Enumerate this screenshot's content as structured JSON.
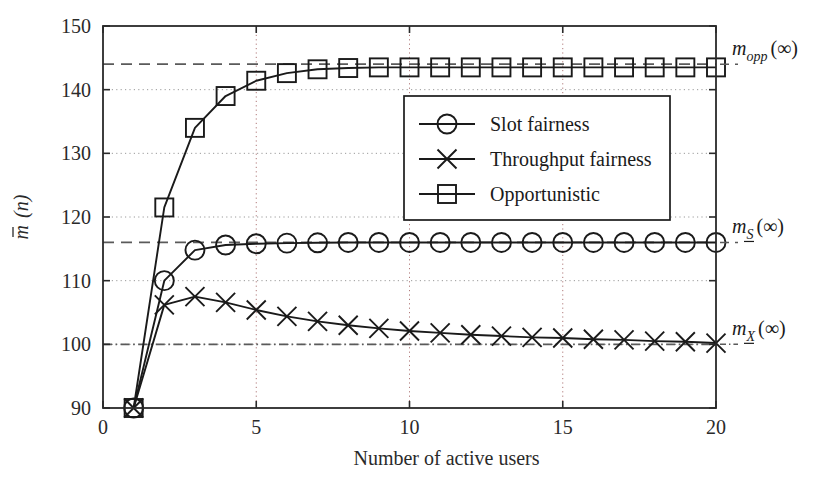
{
  "chart_data": {
    "type": "line",
    "title": "",
    "xlabel": "Number of active users",
    "ylabel": "m̄ (n)",
    "ylabel_parts": {
      "sym": "m",
      "overbar": true,
      "arg": "(n)"
    },
    "xlim": [
      0,
      20
    ],
    "ylim": [
      90,
      150
    ],
    "xticks": [
      0,
      5,
      10,
      15,
      20
    ],
    "xtick_labels": [
      "0",
      "5",
      "10",
      "15",
      "20"
    ],
    "yticks": [
      90,
      100,
      110,
      120,
      130,
      140,
      150
    ],
    "ytick_labels": [
      "90",
      "100",
      "110",
      "120",
      "130",
      "140",
      "150"
    ],
    "grid": true,
    "grid_style": "dotted",
    "grid_x_values": [
      5,
      10,
      15
    ],
    "grid_y_values": [
      100,
      110,
      120,
      130,
      140
    ],
    "legend_position": "upper-center-right",
    "x": [
      1,
      2,
      3,
      4,
      5,
      6,
      7,
      8,
      9,
      10,
      11,
      12,
      13,
      14,
      15,
      16,
      17,
      18,
      19,
      20
    ],
    "series": [
      {
        "name": "Slot fairness",
        "marker": "circle",
        "color": "#1a1a1a",
        "values": [
          90,
          110.0,
          114.8,
          115.6,
          115.8,
          115.9,
          115.95,
          116.0,
          116.0,
          116.0,
          116.0,
          116.0,
          116.0,
          116.0,
          116.0,
          116.0,
          116.0,
          116.0,
          116.0,
          116.0
        ]
      },
      {
        "name": "Throughput fairness",
        "marker": "cross",
        "color": "#1a1a1a",
        "values": [
          90,
          106.2,
          107.5,
          106.6,
          105.4,
          104.4,
          103.6,
          103.0,
          102.5,
          102.1,
          101.8,
          101.5,
          101.3,
          101.1,
          101.0,
          100.8,
          100.7,
          100.5,
          100.4,
          100.2
        ]
      },
      {
        "name": "Opportunistic",
        "marker": "square",
        "color": "#1a1a1a",
        "values": [
          90,
          121.5,
          134.0,
          139.0,
          141.4,
          142.6,
          143.2,
          143.4,
          143.5,
          143.5,
          143.5,
          143.5,
          143.5,
          143.5,
          143.5,
          143.5,
          143.5,
          143.5,
          143.5,
          143.5
        ]
      }
    ],
    "asymptotes": [
      {
        "label_sym": "m",
        "label_sub": "opp",
        "label_arg": "(∞)",
        "value": 144.0,
        "style": "dashed",
        "sub_underline": false,
        "color": "#5a5a5a"
      },
      {
        "label_sym": "m",
        "label_sub": "S",
        "label_arg": "(∞)",
        "value": 116.0,
        "style": "dashed",
        "sub_underline": true,
        "color": "#5a5a5a"
      },
      {
        "label_sym": "m",
        "label_sub": "X",
        "label_arg": "(∞)",
        "value": 100.0,
        "style": "dashdot",
        "sub_underline": true,
        "color": "#5a5a5a"
      }
    ]
  },
  "legend": {
    "entries": [
      {
        "label": "Slot fairness",
        "marker": "circle"
      },
      {
        "label": "Throughput fairness",
        "marker": "cross"
      },
      {
        "label": "Opportunistic",
        "marker": "square"
      }
    ]
  }
}
